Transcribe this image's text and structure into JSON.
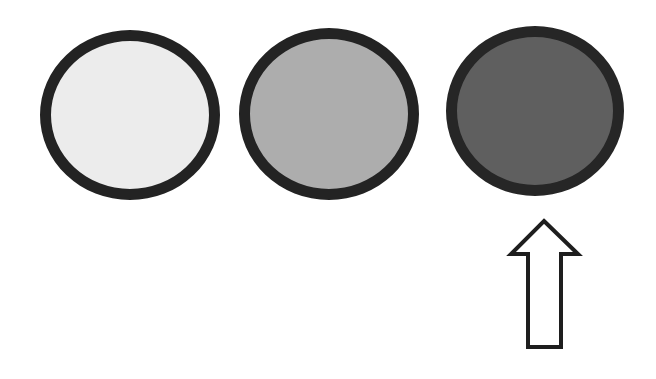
{
  "diagram": {
    "background": "#ffffff",
    "circles": [
      {
        "id": "light",
        "label": "light-gray circle",
        "fill": "#ececec",
        "stroke": "#232323",
        "left": 40,
        "top": 30,
        "width": 180,
        "height": 170,
        "border": 11
      },
      {
        "id": "medium",
        "label": "medium-gray circle",
        "fill": "#adadad",
        "stroke": "#232323",
        "left": 239,
        "top": 28,
        "width": 180,
        "height": 172,
        "border": 11
      },
      {
        "id": "dark",
        "label": "dark-gray circle",
        "fill": "#5f5f5f",
        "stroke": "#262626",
        "left": 446,
        "top": 26,
        "width": 178,
        "height": 170,
        "border": 11
      }
    ],
    "arrow": {
      "direction": "up",
      "points_to": "dark",
      "fill": "#ffffff",
      "stroke": "#1e1e1e",
      "stroke_width": 4
    }
  }
}
